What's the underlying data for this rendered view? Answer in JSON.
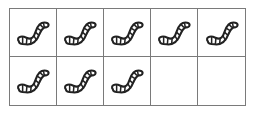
{
  "ten_frame": {
    "rows": 2,
    "columns": 5,
    "total_cells": 10,
    "filled_count": 8,
    "item_icon": "worm-icon",
    "cells": [
      {
        "filled": true
      },
      {
        "filled": true
      },
      {
        "filled": true
      },
      {
        "filled": true
      },
      {
        "filled": true
      },
      {
        "filled": true
      },
      {
        "filled": true
      },
      {
        "filled": true
      },
      {
        "filled": false
      },
      {
        "filled": false
      }
    ],
    "colors": {
      "grid": "#7a7a7a",
      "outline": "#222222",
      "fill": "#ffffff"
    }
  }
}
